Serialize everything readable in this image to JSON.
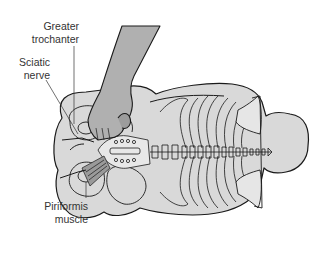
{
  "diagram": {
    "labels": [
      {
        "id": "greater-trochanter",
        "lines": [
          "Greater",
          "trochanter"
        ]
      },
      {
        "id": "sciatic-nerve",
        "lines": [
          "Sciatic",
          "nerve"
        ]
      },
      {
        "id": "piriformis-muscle",
        "lines": [
          "Piriformis",
          "muscle"
        ]
      }
    ],
    "colors": {
      "body_fill": "#d9d9d9",
      "arm_fill": "#b0b0b0",
      "outline": "#1a1a1a",
      "label_text": "#333333",
      "background": "#ffffff"
    }
  }
}
